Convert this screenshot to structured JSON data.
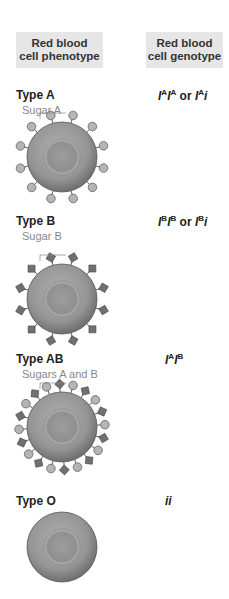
{
  "headers": {
    "phenotype": [
      "Red blood",
      "cell phenotype"
    ],
    "genotype": [
      "Red blood",
      "cell genotype"
    ]
  },
  "colors": {
    "header_bg": "#e6e6e6",
    "cell_fill": "#9a9a9a",
    "sugar_a": "#b5b5b5",
    "sugar_b": "#707070",
    "label_gray": "#888888"
  },
  "rows": [
    {
      "type": "Type A",
      "sugar_label": "Sugar A",
      "genotype_html": "I<sup>A</sup>I<sup>A</sup> <span class='or'>or</span> I<sup>A</sup>i",
      "sugars": "A",
      "label_y": 88,
      "sugar_y": 104,
      "cell_cy": 157
    },
    {
      "type": "Type B",
      "sugar_label": "Sugar B",
      "genotype_html": "I<sup>B</sup>I<sup>B</sup> <span class='or'>or</span> I<sup>B</sup>i",
      "sugars": "B",
      "label_y": 214,
      "sugar_y": 230,
      "cell_cy": 299
    },
    {
      "type": "Type AB",
      "sugar_label": "Sugars A and B",
      "genotype_html": "I<sup>A</sup>I<sup>B</sup>",
      "sugars": "AB",
      "label_y": 352,
      "sugar_y": 368,
      "cell_cy": 427
    },
    {
      "type": "Type O",
      "sugar_label": "",
      "genotype_html": "ii",
      "sugars": "",
      "label_y": 494,
      "sugar_y": 0,
      "cell_cy": 547
    }
  ]
}
